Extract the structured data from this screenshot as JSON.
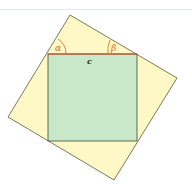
{
  "diagram": {
    "labels": {
      "alpha": "α",
      "beta": "β",
      "side": "c"
    },
    "colors": {
      "outer_fill": "#fdf8c6",
      "inner_fill": "#c9e8c9",
      "outline": "#5a5a3a",
      "hypotenuse": "#d04a20",
      "angle_label": "#d06a20",
      "side_label": "#223322",
      "top_rule": "#dfeaf0"
    },
    "outer_square": {
      "points": [
        [
          70,
          15
        ],
        [
          177,
          78
        ],
        [
          114,
          180
        ],
        [
          8,
          117
        ]
      ]
    },
    "inner_square": {
      "x": 48,
      "y": 54,
      "width": 89,
      "height": 87
    }
  }
}
